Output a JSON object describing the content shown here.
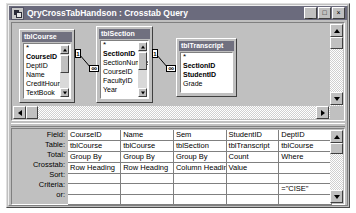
{
  "window": {
    "title": "QryCrossTabHandson : Crosstab Query",
    "icon": "query-window-icon",
    "buttons": {
      "minimize": "_",
      "maximize": "□",
      "close": "×"
    }
  },
  "diagram": {
    "tables": [
      {
        "name": "tblCourse",
        "fields": [
          {
            "label": "*",
            "key": false
          },
          {
            "label": "CourseID",
            "key": true
          },
          {
            "label": "DeptID",
            "key": false
          },
          {
            "label": "Name",
            "key": false
          },
          {
            "label": "CreditHours",
            "key": false
          },
          {
            "label": "TextBook",
            "key": false
          }
        ]
      },
      {
        "name": "tblSection",
        "fields": [
          {
            "label": "*",
            "key": false
          },
          {
            "label": "SectionID",
            "key": true
          },
          {
            "label": "SectionNumbe",
            "key": false
          },
          {
            "label": "CourseID",
            "key": false
          },
          {
            "label": "FacultyID",
            "key": false
          },
          {
            "label": "Year",
            "key": false
          }
        ]
      },
      {
        "name": "tblTranscript",
        "fields": [
          {
            "label": "*",
            "key": false
          },
          {
            "label": "SectionID",
            "key": true
          },
          {
            "label": "StudentID",
            "key": true
          },
          {
            "label": "Grade",
            "key": false
          }
        ]
      }
    ],
    "joins": [
      {
        "from": "tblCourse",
        "to": "tblSection",
        "left_cardinality": "1",
        "right_cardinality": "∞"
      },
      {
        "from": "tblSection",
        "to": "tblTranscript",
        "left_cardinality": "1",
        "right_cardinality": "∞"
      }
    ]
  },
  "grid": {
    "row_labels": [
      "Field:",
      "Table:",
      "Total:",
      "Crosstab:",
      "Sort:",
      "Criteria:",
      "or:"
    ],
    "columns": [
      {
        "field": "CourseID",
        "table": "tblCourse",
        "total": "Group By",
        "crosstab": "Row Heading",
        "sort": "",
        "criteria": "",
        "or": ""
      },
      {
        "field": "Name",
        "table": "tblCourse",
        "total": "Group By",
        "crosstab": "Row Heading",
        "sort": "",
        "criteria": "",
        "or": ""
      },
      {
        "field": "Sem",
        "table": "tblSection",
        "total": "Group By",
        "crosstab": "Column Heading",
        "sort": "",
        "criteria": "",
        "or": ""
      },
      {
        "field": "StudentID",
        "table": "tblTranscript",
        "total": "Count",
        "crosstab": "Value",
        "sort": "",
        "criteria": "",
        "or": ""
      },
      {
        "field": "DeptID",
        "table": "tblCourse",
        "total": "Where",
        "crosstab": "",
        "sort": "",
        "criteria": "=\"CISE\"",
        "or": ""
      }
    ]
  },
  "colors": {
    "window_face": "#c0c0c0",
    "titlebar": "#6b6b7d",
    "table_header": "#70707f",
    "grid_background": "#ffffff"
  }
}
